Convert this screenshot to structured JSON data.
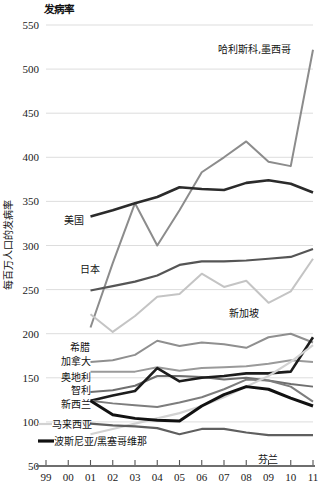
{
  "chart_data": {
    "type": "line",
    "title": "发病率",
    "xlabel": "",
    "ylabel": "每百万人口的发病率",
    "ylim": [
      50,
      550
    ],
    "yticks": [
      50,
      100,
      150,
      200,
      250,
      300,
      350,
      400,
      450,
      500,
      550
    ],
    "grid": true,
    "legend_position": "inline-labels",
    "x": [
      "99",
      "00",
      "01",
      "02",
      "03",
      "04",
      "05",
      "06",
      "07",
      "08",
      "09",
      "10",
      "11"
    ],
    "series": [
      {
        "name": "哈利斯科,墨西哥",
        "color": "#8c8c8c",
        "width": 2.0,
        "label_x": "07",
        "label_anchor": "end",
        "label_value": 505,
        "x": [
          "01",
          "02",
          "03",
          "04",
          "05",
          "06",
          "07",
          "08",
          "09",
          "10",
          "11"
        ],
        "values": [
          207,
          280,
          348,
          300,
          340,
          383,
          400,
          418,
          395,
          390,
          522
        ]
      },
      {
        "name": "美国",
        "color": "#2b2b2b",
        "width": 2.6,
        "label_x": "02",
        "label_anchor": "end",
        "label_value": 322,
        "x": [
          "01",
          "02",
          "03",
          "04",
          "05",
          "06",
          "07",
          "08",
          "09",
          "10",
          "11"
        ],
        "values": [
          333,
          340,
          348,
          355,
          366,
          364,
          363,
          371,
          374,
          370,
          360
        ]
      },
      {
        "name": "日本",
        "color": "#555555",
        "width": 2.2,
        "label_x": "02",
        "label_anchor": "end",
        "label_value": 258,
        "x": [
          "01",
          "02",
          "03",
          "04",
          "05",
          "06",
          "07",
          "08",
          "09",
          "10",
          "11"
        ],
        "values": [
          249,
          254,
          259,
          266,
          278,
          282,
          282,
          283,
          285,
          287,
          296
        ]
      },
      {
        "name": "新加坡",
        "color": "#c4c4c4",
        "width": 2.0,
        "label_x": "08",
        "label_anchor": "end",
        "label_value": 222,
        "x": [
          "01",
          "02",
          "03",
          "04",
          "05",
          "06",
          "07",
          "08",
          "09",
          "10",
          "11"
        ],
        "values": [
          222,
          202,
          220,
          242,
          245,
          268,
          253,
          260,
          235,
          248,
          285
        ]
      },
      {
        "name": "希腊",
        "color": "#8f8f8f",
        "width": 2.0,
        "label_x": "02",
        "label_anchor": "end",
        "label_value": 169,
        "x": [
          "01",
          "02",
          "03",
          "04",
          "05",
          "06",
          "07",
          "08",
          "09",
          "10",
          "11"
        ],
        "values": [
          168,
          170,
          176,
          192,
          186,
          190,
          188,
          184,
          196,
          200,
          190
        ]
      },
      {
        "name": "加拿大",
        "color": "#9a9a9a",
        "width": 2.0,
        "label_x": "02",
        "label_anchor": "end",
        "label_value": 155,
        "x": [
          "01",
          "02",
          "03",
          "04",
          "05",
          "06",
          "07",
          "08",
          "09",
          "10",
          "11"
        ],
        "values": [
          157,
          157,
          157,
          162,
          158,
          161,
          162,
          163,
          166,
          170,
          168
        ]
      },
      {
        "name": "奥地利",
        "color": "#6f6f6f",
        "width": 2.0,
        "label_x": "02",
        "label_anchor": "end",
        "label_value": 137,
        "x": [
          "01",
          "02",
          "03",
          "04",
          "05",
          "06",
          "07",
          "08",
          "09",
          "10",
          "11"
        ],
        "values": [
          134,
          136,
          141,
          152,
          152,
          151,
          148,
          150,
          147,
          143,
          140
        ]
      },
      {
        "name": "智利",
        "color": "#1c1c1c",
        "width": 2.6,
        "label_x": "02",
        "label_anchor": "end",
        "label_value": 125,
        "x": [
          "01",
          "02",
          "03",
          "04",
          "05",
          "06",
          "07",
          "08",
          "09",
          "10",
          "11"
        ],
        "values": [
          124,
          130,
          135,
          161,
          146,
          150,
          152,
          155,
          155,
          157,
          196
        ]
      },
      {
        "name": "新西兰",
        "color": "#7d7d7d",
        "width": 2.0,
        "label_x": "02",
        "label_anchor": "end",
        "label_value": 112,
        "x": [
          "01",
          "02",
          "03",
          "04",
          "05",
          "06",
          "07",
          "08",
          "09",
          "10",
          "11"
        ],
        "values": [
          124,
          121,
          119,
          117,
          122,
          128,
          137,
          148,
          147,
          140,
          123
        ]
      },
      {
        "name": "马来西亚",
        "color": "#d2d2d2",
        "width": 2.2,
        "label_x": "02",
        "label_anchor": "end",
        "label_value": 91,
        "x": [
          "01",
          "02",
          "03",
          "04",
          "05",
          "06",
          "07",
          "08",
          "09",
          "10",
          "11"
        ],
        "values": [
          86,
          92,
          98,
          104,
          110,
          118,
          128,
          140,
          152,
          168,
          187
        ]
      },
      {
        "name": "波斯尼亚/黑塞哥维那",
        "color": "#111111",
        "width": 3.0,
        "label_x": "02",
        "label_anchor": "end",
        "label_value": 78,
        "x": [
          "01",
          "02",
          "03",
          "04",
          "05",
          "06",
          "07",
          "08",
          "09",
          "10",
          "11"
        ],
        "values": [
          124,
          108,
          104,
          102,
          101,
          118,
          131,
          140,
          137,
          127,
          118
        ]
      },
      {
        "name": "芬兰",
        "color": "#5f5f5f",
        "width": 2.2,
        "label_x": "10",
        "label_anchor": "middle",
        "label_value": 62,
        "x": [
          "01",
          "02",
          "03",
          "04",
          "05",
          "06",
          "07",
          "08",
          "09",
          "10",
          "11"
        ],
        "values": [
          98,
          96,
          95,
          93,
          86,
          92,
          92,
          88,
          85,
          85,
          85
        ]
      }
    ]
  },
  "labels": {
    "title": "发病率",
    "ylabel": "每百万人口的发病率",
    "series_labels": [
      {
        "name": "哈利斯科,墨西哥",
        "x": 218,
        "y": 53
      },
      {
        "name": "美国",
        "x": 64,
        "y": 224
      },
      {
        "name": "日本",
        "x": 80,
        "y": 273
      },
      {
        "name": "新加坡",
        "x": 229,
        "y": 317
      },
      {
        "name": "希腊",
        "x": 70,
        "y": 351
      },
      {
        "name": "加拿大",
        "x": 61,
        "y": 365
      },
      {
        "name": "奥地利",
        "x": 61,
        "y": 381
      },
      {
        "name": "智利",
        "x": 71,
        "y": 394
      },
      {
        "name": "新西兰",
        "x": 61,
        "y": 408
      },
      {
        "name": "马来西亚",
        "x": 52,
        "y": 428
      },
      {
        "name": "波斯尼亚/黑塞哥维那",
        "x": 54,
        "y": 445
      },
      {
        "name": "芬兰",
        "x": 258,
        "y": 463
      }
    ],
    "legend_swatches": [
      {
        "name": "malaysia-swatch",
        "color": "#d2d2d2"
      },
      {
        "name": "bosnia-swatch",
        "color": "#111111"
      }
    ]
  }
}
